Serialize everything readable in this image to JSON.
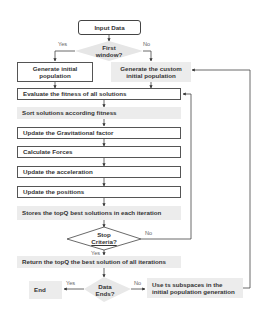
{
  "flowchart": {
    "start": "Input Data",
    "decision_first_window": {
      "line1": "First",
      "line2": "window?",
      "yes": "Yes",
      "no": "No"
    },
    "generate_initial": {
      "line1": "Generate initial",
      "line2": "population"
    },
    "generate_custom": {
      "line1": "Generate the custom",
      "line2": "initial population"
    },
    "steps": [
      "Evaluate the fitness of all solutions",
      "Sort solutions according fitness",
      "Update the Gravitational factor",
      "Calculate Forces",
      "Update the acceleration",
      "Update the positions",
      "Stores the topQ best solutions in each iteration"
    ],
    "decision_stop": {
      "line1": "Stop",
      "line2": "Criteria?",
      "yes": "Yes",
      "no": "No"
    },
    "return_step": "Return the topQ the best solution of all iterations",
    "decision_data_ends": {
      "line1": "Data",
      "line2": "Ends?",
      "yes": "Yes",
      "no": "No"
    },
    "end": "End",
    "subspaces": {
      "line1": "Use ts subspaces in the",
      "line2": "initial population generation"
    }
  }
}
